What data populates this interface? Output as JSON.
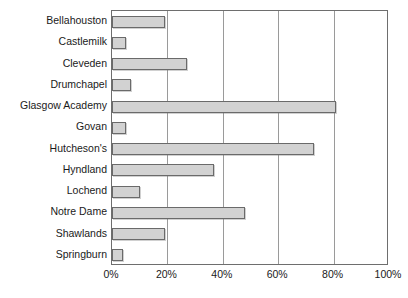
{
  "chart_data": {
    "type": "bar",
    "orientation": "horizontal",
    "title": "",
    "subtitle": "",
    "xlabel": "",
    "ylabel": "",
    "xlim": [
      0,
      100
    ],
    "xticks": [
      0,
      20,
      40,
      60,
      80,
      100
    ],
    "xtick_labels": [
      "0%",
      "20%",
      "40%",
      "60%",
      "80%",
      "100%"
    ],
    "grid": "vertical",
    "legend": "none",
    "categories": [
      "Bellahouston",
      "Castlemilk",
      "Cleveden",
      "Drumchapel",
      "Glasgow Academy",
      "Govan",
      "Hutcheson's",
      "Hyndland",
      "Lochend",
      "Notre Dame",
      "Shawlands",
      "Springburn"
    ],
    "values": [
      19,
      5,
      27,
      7,
      81,
      5,
      73,
      37,
      10,
      48,
      19,
      4
    ],
    "bar_fill_color": "#d2d2d2",
    "bar_border_color": "#6a6a6a",
    "axis_color": "#6e6e6e",
    "gridline_color": "#9a9a9a",
    "text_color": "#1a1a1a"
  }
}
